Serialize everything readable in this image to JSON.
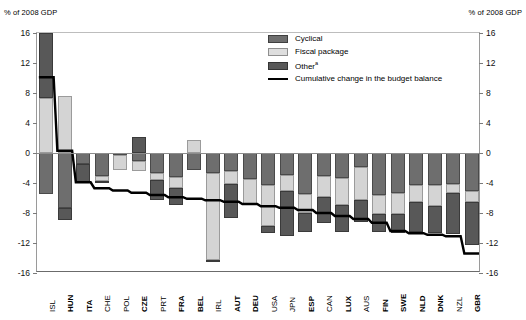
{
  "axis_unit_left": "% of 2008 GDP",
  "axis_unit_right": "% of 2008 GDP",
  "legend": {
    "items": [
      {
        "key": "cyclical",
        "label": "Cyclical"
      },
      {
        "key": "fiscal",
        "label": "Fiscal package"
      },
      {
        "key": "other",
        "label": "Other",
        "note": "a"
      },
      {
        "key": "line",
        "label": "Cumulative change in the budget balance"
      }
    ]
  },
  "colors": {
    "cyclical": "#6e6e6e",
    "fiscal": "#d4d4d4",
    "other": "#585858",
    "line": "#000000",
    "axis": "#8c8c8c"
  },
  "chart_data": {
    "type": "bar",
    "subtype": "stacked-bar-with-line",
    "title": "",
    "xlabel": "",
    "ylabel": "% of 2008 GDP",
    "ylim": [
      -16,
      16
    ],
    "yticks": [
      16,
      12,
      8,
      4,
      0,
      -4,
      -8,
      -12,
      -16
    ],
    "ytick_labels": [
      "16",
      "12",
      "8",
      "4",
      "0",
      "-4",
      "-8",
      "-12",
      "-16"
    ],
    "grid": false,
    "legend_position": "top-right",
    "categories": [
      "ISL",
      "HUN",
      "ITA",
      "CHE",
      "POL",
      "CZE",
      "PRT",
      "FRA",
      "BEL",
      "IRL",
      "AUT",
      "DEU",
      "USA",
      "JPN",
      "ESP",
      "CAN",
      "LUX",
      "AUS",
      "FIN",
      "SWE",
      "NLD",
      "DNK",
      "NZL",
      "GBR"
    ],
    "bold_categories": [
      "HUN",
      "ITA",
      "CZE",
      "FRA",
      "BEL",
      "AUT",
      "DEU",
      "ESP",
      "LUX",
      "FIN",
      "SWE",
      "NLD",
      "DNK",
      "GBR"
    ],
    "series": [
      {
        "name": "Cyclical",
        "values": [
          -5.5,
          -7.3,
          -1.4,
          -3.1,
          -0.3,
          -1.0,
          -2.7,
          -3.2,
          -2.2,
          -2.6,
          -2.4,
          -3.5,
          -4.2,
          -2.9,
          -5.4,
          -3.0,
          -3.3,
          -1.9,
          -5.6,
          -5.3,
          -4.2,
          -4.3,
          -4.1,
          -5.0
        ]
      },
      {
        "name": "Fiscal package",
        "values": [
          7.3,
          7.6,
          0.0,
          -0.6,
          -1.9,
          -1.4,
          -0.9,
          -1.4,
          1.8,
          -11.6,
          -1.7,
          -3.4,
          -5.5,
          -2.2,
          -2.6,
          -2.8,
          -3.6,
          -4.3,
          -2.5,
          -2.8,
          -2.3,
          -2.7,
          -1.2,
          -1.5
        ]
      },
      {
        "name": "Other",
        "values": [
          9.2,
          -1.6,
          -2.5,
          -0.3,
          0.0,
          2.1,
          -2.6,
          -2.3,
          0.0,
          -0.1,
          -4.5,
          0.0,
          -1.0,
          -6.0,
          -2.5,
          -3.5,
          -3.6,
          -3.0,
          -2.4,
          -2.5,
          -4.0,
          -3.7,
          -5.5,
          -5.8
        ]
      }
    ],
    "line_series": {
      "name": "Cumulative change in the budget balance",
      "values": [
        10.1,
        0.3,
        -3.9,
        -4.7,
        -5.0,
        -5.3,
        -5.6,
        -5.9,
        -6.1,
        -6.3,
        -6.5,
        -6.8,
        -7.1,
        -7.3,
        -7.6,
        -8.0,
        -8.4,
        -8.8,
        -9.3,
        -10.4,
        -10.7,
        -10.9,
        -11.1,
        -13.4
      ]
    },
    "notes": {
      "clipped_bars": [
        {
          "category": "ISL",
          "top_value": 16.5,
          "clipped_at": 16
        }
      ]
    }
  }
}
